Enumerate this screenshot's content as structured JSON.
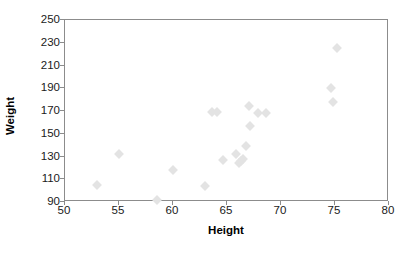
{
  "chart_data": {
    "type": "scatter",
    "title": "",
    "xlabel": "Height",
    "ylabel": "Weight",
    "xlim": [
      50,
      80
    ],
    "ylim": [
      90,
      250
    ],
    "xticks": [
      50,
      55,
      60,
      65,
      70,
      75,
      80
    ],
    "yticks": [
      90,
      110,
      130,
      150,
      170,
      190,
      210,
      230,
      250
    ],
    "grid": false,
    "legend": null,
    "marker": {
      "shape": "diamond",
      "color": "#e3e3e3",
      "size": 7
    },
    "frame_color": "#8c8c8c",
    "background": "#ffffff",
    "series": [
      {
        "name": "observations",
        "points": [
          [
            53.0,
            105
          ],
          [
            55.0,
            132
          ],
          [
            58.5,
            92
          ],
          [
            60.0,
            118
          ],
          [
            63.0,
            104
          ],
          [
            63.6,
            169
          ],
          [
            64.1,
            169
          ],
          [
            64.6,
            127
          ],
          [
            65.8,
            132
          ],
          [
            66.1,
            124
          ],
          [
            66.3,
            126
          ],
          [
            66.5,
            128
          ],
          [
            66.8,
            139
          ],
          [
            67.0,
            174
          ],
          [
            67.1,
            157
          ],
          [
            67.9,
            168
          ],
          [
            68.6,
            168
          ],
          [
            74.6,
            190
          ],
          [
            74.8,
            178
          ],
          [
            75.2,
            225
          ]
        ]
      }
    ],
    "n_points": 20
  },
  "axis": {
    "x_tick_labels": [
      "50",
      "55",
      "60",
      "65",
      "70",
      "75",
      "80"
    ],
    "y_tick_labels": [
      "250",
      "230",
      "210",
      "190",
      "170",
      "150",
      "130",
      "110",
      "90"
    ],
    "x_title": "Height",
    "y_title": "Weight"
  }
}
